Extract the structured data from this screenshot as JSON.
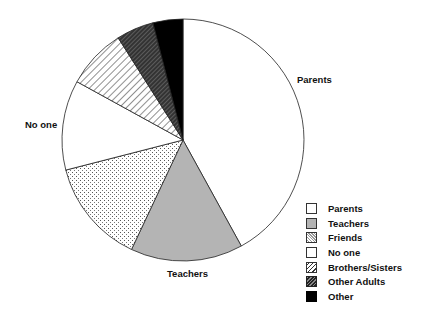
{
  "chart_data": {
    "type": "pie",
    "title": "",
    "categories": [
      "Parents",
      "Teachers",
      "Friends",
      "No one",
      "Brothers/Sisters",
      "Other Adults",
      "Other"
    ],
    "values": [
      42,
      15,
      14,
      12,
      8,
      5,
      4
    ],
    "unit": "percent (estimated)",
    "start_angle": "12 o'clock",
    "direction": "clockwise",
    "slice_labels": [
      "Parents",
      "Teachers",
      "No one"
    ],
    "legend_position": "bottom-right",
    "patterns": [
      "white",
      "gray",
      "dotted",
      "white",
      "diagonal-hatch",
      "dense-hatch",
      "black"
    ]
  },
  "labels": {
    "parents": "Parents",
    "teachers": "Teachers",
    "no_one": "No one"
  },
  "legend": {
    "items": [
      {
        "label": "Parents"
      },
      {
        "label": "Teachers"
      },
      {
        "label": "Friends"
      },
      {
        "label": "No one"
      },
      {
        "label": "Brothers/Sisters"
      },
      {
        "label": "Other Adults"
      },
      {
        "label": "Other"
      }
    ]
  }
}
